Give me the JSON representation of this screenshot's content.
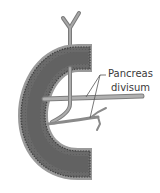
{
  "diagram": {
    "label": {
      "line1": "Pancreas",
      "line2": "divisum"
    },
    "colors": {
      "duodenum_wall": "#6e6e6e",
      "duodenum_inner": "#5a5a5a",
      "duodenum_rim": "#9a9a9a",
      "duct": "#9c9c9c",
      "duct_outline": "#7a7a7a",
      "leader_line": "#555555",
      "background": "#ffffff"
    }
  }
}
